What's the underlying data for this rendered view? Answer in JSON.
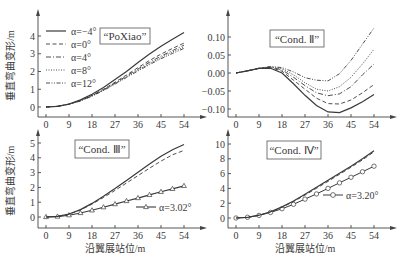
{
  "figure": {
    "ylabel_shared": "垂直弯曲变形/m",
    "xlabel_shared": "沿翼展站位/m",
    "caption": ""
  },
  "chart_data": [
    {
      "type": "line",
      "panel": "top-left",
      "title": "“PoXiao”",
      "xlabel": "",
      "ylabel": "垂直弯曲变形/m",
      "x": [
        0,
        4.5,
        9,
        13.5,
        18,
        22.5,
        27,
        31.5,
        36,
        40.5,
        45,
        49.5,
        54
      ],
      "xticks": [
        0,
        9,
        18,
        27,
        36,
        45,
        54
      ],
      "yticks": [
        0,
        1,
        2,
        3,
        4
      ],
      "xlim": [
        0,
        58
      ],
      "ylim": [
        -0.2,
        4.6
      ],
      "legend_position": "upper left",
      "series": [
        {
          "name": "α=−4°",
          "style": "solid",
          "values": [
            0,
            0.04,
            0.17,
            0.4,
            0.72,
            1.1,
            1.55,
            2.0,
            2.5,
            2.98,
            3.42,
            3.82,
            4.2
          ]
        },
        {
          "name": "α=0°",
          "style": "dashed",
          "values": [
            0,
            0.04,
            0.16,
            0.37,
            0.66,
            1.0,
            1.4,
            1.8,
            2.22,
            2.62,
            2.98,
            3.3,
            3.6
          ]
        },
        {
          "name": "α=4°",
          "style": "dash-dot",
          "values": [
            0,
            0.04,
            0.16,
            0.36,
            0.64,
            0.97,
            1.35,
            1.74,
            2.14,
            2.52,
            2.87,
            3.18,
            3.48
          ]
        },
        {
          "name": "α=8°",
          "style": "dotted",
          "values": [
            0,
            0.04,
            0.16,
            0.35,
            0.63,
            0.95,
            1.32,
            1.7,
            2.08,
            2.45,
            2.79,
            3.1,
            3.38
          ]
        },
        {
          "name": "α=12°",
          "style": "dash-dot-dot",
          "values": [
            0,
            0.04,
            0.15,
            0.34,
            0.61,
            0.93,
            1.29,
            1.66,
            2.03,
            2.39,
            2.72,
            3.02,
            3.3
          ]
        }
      ]
    },
    {
      "type": "line",
      "panel": "top-right",
      "title": "“Cond. Ⅱ”",
      "xlabel": "",
      "ylabel": "",
      "x": [
        0,
        4.5,
        9,
        13.5,
        18,
        22.5,
        27,
        31.5,
        36,
        40.5,
        45,
        49.5,
        54
      ],
      "xticks": [
        0,
        9,
        18,
        27,
        36,
        45,
        54
      ],
      "yticks": [
        -0.1,
        -0.05,
        0.0,
        0.05,
        0.1
      ],
      "ylim": [
        -0.12,
        0.12
      ],
      "series": [
        {
          "name": "α=−4°",
          "style": "solid",
          "values": [
            0,
            0.006,
            0.013,
            0.013,
            0.0,
            -0.03,
            -0.062,
            -0.09,
            -0.108,
            -0.11,
            -0.097,
            -0.08,
            -0.06
          ]
        },
        {
          "name": "α=0°",
          "style": "dashed",
          "values": [
            0,
            0.006,
            0.013,
            0.015,
            0.005,
            -0.02,
            -0.045,
            -0.07,
            -0.085,
            -0.086,
            -0.075,
            -0.055,
            -0.032
          ]
        },
        {
          "name": "α=4°",
          "style": "dash-dot",
          "values": [
            0,
            0.006,
            0.013,
            0.016,
            0.009,
            -0.012,
            -0.035,
            -0.055,
            -0.063,
            -0.058,
            -0.038,
            -0.005,
            0.025
          ]
        },
        {
          "name": "α=8°",
          "style": "dotted",
          "values": [
            0,
            0.006,
            0.013,
            0.017,
            0.012,
            -0.005,
            -0.027,
            -0.045,
            -0.05,
            -0.038,
            -0.012,
            0.025,
            0.066
          ]
        },
        {
          "name": "α=12°",
          "style": "dash-dot-dot",
          "values": [
            0,
            0.006,
            0.013,
            0.018,
            0.015,
            0.003,
            -0.013,
            -0.02,
            -0.022,
            -0.002,
            0.035,
            0.08,
            0.125
          ]
        }
      ]
    },
    {
      "type": "line",
      "panel": "bottom-left",
      "title": "“Cond. Ⅲ”",
      "xlabel": "沿翼展站位/m",
      "ylabel": "垂直弯曲变形/m",
      "x": [
        0,
        4.5,
        9,
        13.5,
        18,
        22.5,
        27,
        31.5,
        36,
        40.5,
        45,
        49.5,
        54
      ],
      "xticks": [
        0,
        9,
        18,
        27,
        36,
        45,
        54
      ],
      "yticks": [
        0,
        1,
        2,
        3,
        4,
        5
      ],
      "ylim": [
        -0.2,
        5.5
      ],
      "annotation": "α=3.02°",
      "series": [
        {
          "name": "α=3.02°",
          "style": "solid-triangle",
          "values": [
            0,
            0.03,
            0.12,
            0.27,
            0.45,
            0.66,
            0.87,
            1.08,
            1.28,
            1.49,
            1.7,
            1.9,
            2.1
          ]
        },
        {
          "name": "other-solid",
          "style": "solid",
          "values": [
            0,
            0.05,
            0.2,
            0.5,
            0.92,
            1.4,
            1.92,
            2.47,
            3.02,
            3.58,
            4.1,
            4.55,
            4.9
          ]
        },
        {
          "name": "other-dashed",
          "style": "dashed",
          "values": [
            0,
            0.05,
            0.19,
            0.47,
            0.87,
            1.32,
            1.8,
            2.3,
            2.8,
            3.3,
            3.78,
            4.2,
            4.5
          ]
        }
      ]
    },
    {
      "type": "line",
      "panel": "bottom-right",
      "title": "“Cond. Ⅳ”",
      "xlabel": "沿翼展站位/m",
      "ylabel": "",
      "x": [
        0,
        4.5,
        9,
        13.5,
        18,
        22.5,
        27,
        31.5,
        36,
        40.5,
        45,
        49.5,
        54
      ],
      "xticks": [
        0,
        9,
        18,
        27,
        36,
        45,
        54
      ],
      "yticks": [
        0,
        2,
        4,
        6,
        8,
        10
      ],
      "ylim": [
        -0.5,
        10.5
      ],
      "annotation": "α=3.20°",
      "series": [
        {
          "name": "α=3.20°",
          "style": "solid-circle",
          "values": [
            0,
            0.1,
            0.35,
            0.75,
            1.25,
            1.85,
            2.55,
            3.25,
            4.0,
            4.75,
            5.5,
            6.25,
            7.0
          ]
        },
        {
          "name": "other-solid",
          "style": "solid",
          "values": [
            0,
            0.1,
            0.38,
            0.85,
            1.5,
            2.3,
            3.2,
            4.15,
            5.1,
            6.05,
            7.0,
            8.0,
            9.1
          ]
        },
        {
          "name": "other-dashed",
          "style": "dashed",
          "values": [
            0,
            0.1,
            0.37,
            0.82,
            1.45,
            2.22,
            3.1,
            4.02,
            4.95,
            5.9,
            6.85,
            7.85,
            8.95
          ]
        }
      ]
    }
  ]
}
